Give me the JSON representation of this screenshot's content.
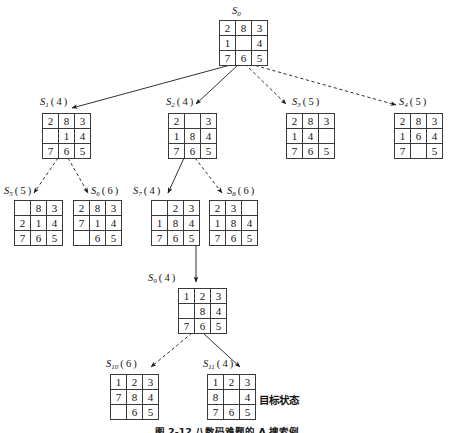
{
  "figure": {
    "caption": "图 2-12   八数码难题的 A 搜索例",
    "goal_state_text": "目标状态"
  },
  "legend": {
    "solid_edge_meaning": "solid-arrow",
    "dashed_edge_meaning": "dashed-arrow"
  },
  "nodes": [
    {
      "id": "S0",
      "name": "S",
      "subscript": "0",
      "cost": "",
      "label": "S0",
      "label_display": "S",
      "grid": [
        [
          "2",
          "8",
          "3"
        ],
        [
          "1",
          "",
          "4"
        ],
        [
          "7",
          "6",
          "5"
        ]
      ],
      "x": 219,
      "y": 20,
      "label_x": 232,
      "label_y": 6,
      "label_align": "above"
    },
    {
      "id": "S1",
      "name": "S",
      "subscript": "1",
      "cost": "4",
      "label": "S1(4)",
      "grid": [
        [
          "2",
          "8",
          "3"
        ],
        [
          "",
          "1",
          "4"
        ],
        [
          "7",
          "6",
          "5"
        ]
      ],
      "x": 42,
      "y": 113,
      "label_x": 40,
      "label_y": 97,
      "label_align": "above"
    },
    {
      "id": "S2",
      "name": "S",
      "subscript": "2",
      "cost": "4",
      "label": "S2(4)",
      "grid": [
        [
          "2",
          "",
          "3"
        ],
        [
          "1",
          "8",
          "4"
        ],
        [
          "7",
          "6",
          "5"
        ]
      ],
      "x": 168,
      "y": 113,
      "label_x": 166,
      "label_y": 97,
      "label_align": "above"
    },
    {
      "id": "S3",
      "name": "S",
      "subscript": "3",
      "cost": "5",
      "label": "S3(5)",
      "grid": [
        [
          "2",
          "8",
          "3"
        ],
        [
          "1",
          "4",
          ""
        ],
        [
          "7",
          "6",
          "5"
        ]
      ],
      "x": 286,
      "y": 113,
      "label_x": 292,
      "label_y": 97,
      "label_align": "above"
    },
    {
      "id": "S4",
      "name": "S",
      "subscript": "4",
      "cost": "5",
      "label": "S4(5)",
      "grid": [
        [
          "2",
          "8",
          "3"
        ],
        [
          "1",
          "6",
          "4"
        ],
        [
          "7",
          "",
          "5"
        ]
      ],
      "x": 394,
      "y": 113,
      "label_x": 399,
      "label_y": 97,
      "label_align": "above"
    },
    {
      "id": "S5",
      "name": "S",
      "subscript": "5",
      "cost": "5",
      "label": "S5(5)",
      "grid": [
        [
          "",
          "8",
          "3"
        ],
        [
          "2",
          "1",
          "4"
        ],
        [
          "7",
          "6",
          "5"
        ]
      ],
      "x": 14,
      "y": 200,
      "label_x": 4,
      "label_y": 186,
      "label_align": "above"
    },
    {
      "id": "S6",
      "name": "S",
      "subscript": "6",
      "cost": "6",
      "label": "S6(6)",
      "grid": [
        [
          "2",
          "8",
          "3"
        ],
        [
          "7",
          "1",
          "4"
        ],
        [
          "",
          "6",
          "5"
        ]
      ],
      "x": 73,
      "y": 200,
      "label_x": 91,
      "label_y": 186,
      "label_align": "above"
    },
    {
      "id": "S7",
      "name": "S",
      "subscript": "7",
      "cost": "4",
      "label": "S7(4)",
      "grid": [
        [
          "",
          "2",
          "3"
        ],
        [
          "1",
          "8",
          "4"
        ],
        [
          "7",
          "6",
          "5"
        ]
      ],
      "x": 151,
      "y": 200,
      "label_x": 133,
      "label_y": 186,
      "label_align": "above"
    },
    {
      "id": "S8",
      "name": "S",
      "subscript": "8",
      "cost": "6",
      "label": "S8(6)",
      "grid": [
        [
          "2",
          "3",
          ""
        ],
        [
          "1",
          "8",
          "4"
        ],
        [
          "7",
          "6",
          "5"
        ]
      ],
      "x": 209,
      "y": 200,
      "label_x": 227,
      "label_y": 186,
      "label_align": "above"
    },
    {
      "id": "S9",
      "name": "S",
      "subscript": "9",
      "cost": "4",
      "label": "S9(4)",
      "grid": [
        [
          "1",
          "2",
          "3"
        ],
        [
          "",
          "8",
          "4"
        ],
        [
          "7",
          "6",
          "5"
        ]
      ],
      "x": 178,
      "y": 288,
      "label_x": 148,
      "label_y": 273,
      "label_align": "left"
    },
    {
      "id": "S10",
      "name": "S",
      "subscript": "10",
      "cost": "6",
      "label": "S10(6)",
      "grid": [
        [
          "1",
          "2",
          "3"
        ],
        [
          "7",
          "8",
          "4"
        ],
        [
          "",
          "6",
          "5"
        ]
      ],
      "x": 110,
      "y": 374,
      "label_x": 106,
      "label_y": 359,
      "label_align": "above"
    },
    {
      "id": "S11",
      "name": "S",
      "subscript": "11",
      "cost": "4",
      "label": "S11(4)",
      "grid": [
        [
          "1",
          "2",
          "3"
        ],
        [
          "8",
          "",
          "4"
        ],
        [
          "7",
          "6",
          "5"
        ]
      ],
      "x": 207,
      "y": 374,
      "label_x": 203,
      "label_y": 359,
      "label_align": "above"
    }
  ],
  "edges": [
    {
      "from": "S0",
      "to": "S1",
      "style": "solid",
      "x1": 234,
      "y1": 64,
      "x2": 72,
      "y2": 108
    },
    {
      "from": "S0",
      "to": "S2",
      "style": "solid",
      "x1": 239,
      "y1": 64,
      "x2": 196,
      "y2": 104
    },
    {
      "from": "S0",
      "to": "S3",
      "style": "dashed",
      "x1": 245,
      "y1": 64,
      "x2": 286,
      "y2": 104
    },
    {
      "from": "S0",
      "to": "S4",
      "style": "dashed",
      "x1": 250,
      "y1": 64,
      "x2": 396,
      "y2": 105
    },
    {
      "from": "S1",
      "to": "S5",
      "style": "dashed",
      "x1": 58,
      "y1": 158,
      "x2": 34,
      "y2": 193
    },
    {
      "from": "S1",
      "to": "S6",
      "style": "dashed",
      "x1": 68,
      "y1": 158,
      "x2": 88,
      "y2": 193
    },
    {
      "from": "S2",
      "to": "S7",
      "style": "solid",
      "x1": 184,
      "y1": 158,
      "x2": 168,
      "y2": 193
    },
    {
      "from": "S2",
      "to": "S8",
      "style": "dashed",
      "x1": 195,
      "y1": 158,
      "x2": 222,
      "y2": 193
    },
    {
      "from": "S7",
      "to": "S9",
      "style": "solid",
      "x1": 196,
      "y1": 245,
      "x2": 196,
      "y2": 282
    },
    {
      "from": "S9",
      "to": "S10",
      "style": "dashed",
      "x1": 192,
      "y1": 333,
      "x2": 151,
      "y2": 367
    },
    {
      "from": "S9",
      "to": "S11",
      "style": "solid",
      "x1": 203,
      "y1": 333,
      "x2": 240,
      "y2": 367
    }
  ],
  "goal_annotation": {
    "text": "目标状态",
    "x": 259,
    "y": 392
  }
}
